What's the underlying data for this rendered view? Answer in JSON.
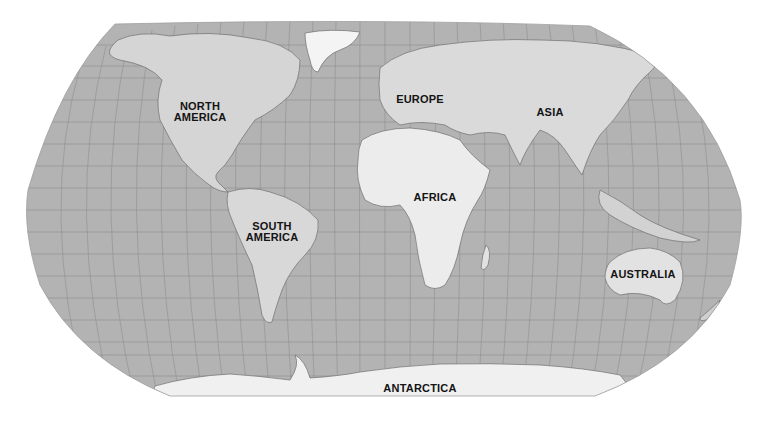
{
  "map": {
    "projection": "Robinson",
    "style": "grayscale shaded relief",
    "colors": {
      "ocean": "#b3b3b3",
      "land": "#d9d9d9",
      "land_light": "#ececec",
      "ice": "#f4f4f4",
      "graticule": "#8e8e8e",
      "label": "#141414",
      "background": "#ffffff"
    },
    "labels": [
      {
        "id": "north-america",
        "lines": [
          "NORTH",
          "AMERICA"
        ],
        "x": 199,
        "y": 101
      },
      {
        "id": "europe",
        "lines": [
          "EUROPE"
        ],
        "x": 420,
        "y": 95
      },
      {
        "id": "asia",
        "lines": [
          "ASIA"
        ],
        "x": 550,
        "y": 107
      },
      {
        "id": "africa",
        "lines": [
          "AFRICA"
        ],
        "x": 435,
        "y": 192
      },
      {
        "id": "south-america",
        "lines": [
          "SOUTH",
          "AMERICA"
        ],
        "x": 272,
        "y": 221
      },
      {
        "id": "australia",
        "lines": [
          "AUSTRALIA"
        ],
        "x": 643,
        "y": 270
      },
      {
        "id": "antarctica",
        "lines": [
          "ANTARCTICA"
        ],
        "x": 420,
        "y": 384
      }
    ]
  }
}
